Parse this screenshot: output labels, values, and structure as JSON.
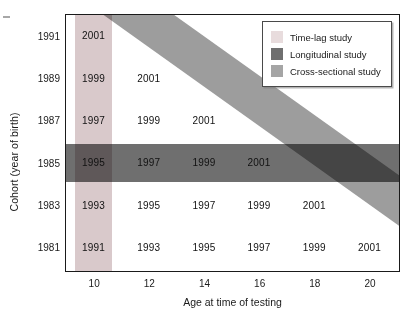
{
  "colors": {
    "time_lag": "#d9c9cb",
    "longitudinal": "#6f6f6f",
    "cross_sectional": "#9d9d9d",
    "axis": "#1a1a1a",
    "text": "#111111"
  },
  "legend": {
    "position": "top-right",
    "items": [
      {
        "label": "Time-lag study",
        "swatch": "time-lag-swatch",
        "color": "#e8dcdd"
      },
      {
        "label": "Longitudinal study",
        "swatch": "longitudinal-swatch",
        "color": "#6f6f6f"
      },
      {
        "label": "Cross-sectional study",
        "swatch": "cross-sectional-swatch",
        "color": "#a5a5a5"
      }
    ]
  },
  "chart_data": {
    "type": "table",
    "title": "",
    "subtitle": "",
    "xlabel": "Age at time of testing",
    "ylabel": "Cohort (year of birth)",
    "x": [
      10,
      12,
      14,
      16,
      18,
      20
    ],
    "xticklabels": [
      "10",
      "12",
      "14",
      "16",
      "18",
      "20"
    ],
    "categories": [
      "1991",
      "1989",
      "1987",
      "1985",
      "1983",
      "1981"
    ],
    "yticklabels": [
      "1991",
      "1989",
      "1987",
      "1985",
      "1983",
      "1981"
    ],
    "grid": false,
    "legend_position": "upper right",
    "cell_description": "Each cell shows the calendar year of testing = cohort birth year + age at testing",
    "rows": [
      {
        "cohort": "1991",
        "cells": [
          "2001",
          "",
          "",
          "",
          "",
          ""
        ]
      },
      {
        "cohort": "1989",
        "cells": [
          "1999",
          "2001",
          "",
          "",
          "",
          ""
        ]
      },
      {
        "cohort": "1987",
        "cells": [
          "1997",
          "1999",
          "2001",
          "",
          "",
          ""
        ]
      },
      {
        "cohort": "1985",
        "cells": [
          "1995",
          "1997",
          "1999",
          "2001",
          "",
          ""
        ]
      },
      {
        "cohort": "1983",
        "cells": [
          "1993",
          "1995",
          "1997",
          "1999",
          "2001",
          ""
        ]
      },
      {
        "cohort": "1981",
        "cells": [
          "1991",
          "1993",
          "1995",
          "1997",
          "1999",
          "2001"
        ]
      }
    ],
    "bands": [
      {
        "name": "time-lag",
        "orientation": "vertical",
        "describes": "Same age (10) measured across different cohorts",
        "column_age": 10,
        "color": "#d9c9cb"
      },
      {
        "name": "longitudinal",
        "orientation": "horizontal",
        "describes": "Single cohort (1985) followed across ages",
        "row_cohort": "1985",
        "color": "#6f6f6f"
      },
      {
        "name": "cross-sectional",
        "orientation": "diagonal",
        "describes": "Different cohorts measured in the same year (2001)",
        "testing_year": "2001",
        "color": "#9d9d9d"
      }
    ]
  }
}
